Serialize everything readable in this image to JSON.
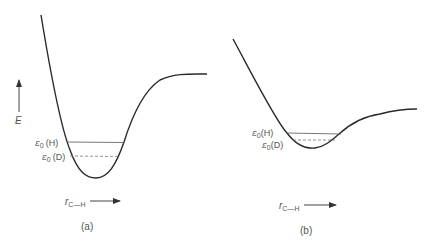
{
  "figure": {
    "panels": [
      {
        "id": "a",
        "caption": "(a)",
        "y_axis_label": "E",
        "x_axis_label": "r",
        "x_axis_subscript": "C—H",
        "levels": [
          {
            "label": "ε",
            "sub": "0",
            "iso": "(H)",
            "style": "solid"
          },
          {
            "label": "ε",
            "sub": "0",
            "iso": "(D)",
            "style": "dashed"
          }
        ]
      },
      {
        "id": "b",
        "caption": "(b)",
        "x_axis_label": "r",
        "x_axis_subscript": "C—H",
        "levels": [
          {
            "label": "ε",
            "sub": "0",
            "iso": "(H)",
            "style": "solid"
          },
          {
            "label": "ε",
            "sub": "0",
            "iso": "(D)",
            "style": "dashed"
          }
        ]
      }
    ]
  },
  "colors": {
    "curve": "#2a2a2a",
    "level": "#555555",
    "text": "#555555"
  }
}
